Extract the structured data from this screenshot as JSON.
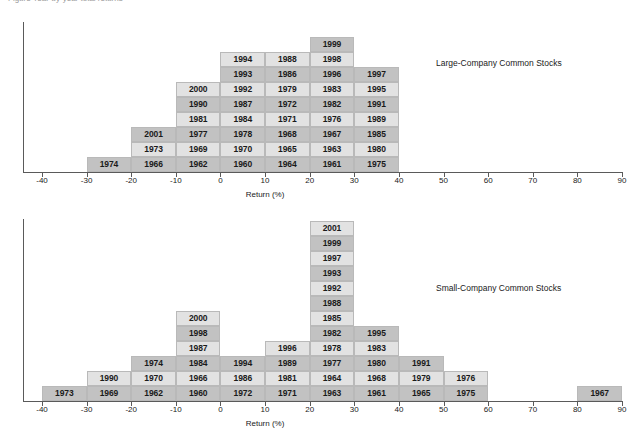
{
  "figure": {
    "title": "Figure  Year-by-year total returns",
    "axis_title": "Return (%)"
  },
  "chart_data": [
    {
      "type": "bar",
      "name": "large-company",
      "title": "Large-Company Common Stocks",
      "xlabel": "Return (%)",
      "ylabel": "",
      "xlim": [
        -45,
        90
      ],
      "bin_width": 10,
      "grid": false,
      "tick_labels": [
        "-40",
        "-30",
        "-20",
        "-10",
        "0",
        "10",
        "20",
        "30",
        "40",
        "50",
        "60",
        "70",
        "80",
        "90"
      ],
      "tick_values": [
        -40,
        -30,
        -20,
        -10,
        0,
        10,
        20,
        30,
        40,
        50,
        60,
        70,
        80,
        90
      ],
      "bins": [
        {
          "start": -30,
          "end": -20,
          "count": 1,
          "labels": [
            "1974"
          ]
        },
        {
          "start": -20,
          "end": -10,
          "count": 3,
          "labels": [
            "1966",
            "1973",
            "2001"
          ]
        },
        {
          "start": -10,
          "end": 0,
          "count": 6,
          "labels": [
            "1962",
            "1969",
            "1977",
            "1981",
            "1990",
            "2000"
          ]
        },
        {
          "start": 0,
          "end": 10,
          "count": 8,
          "labels": [
            "1960",
            "1970",
            "1978",
            "1984",
            "1987",
            "1992",
            "1993",
            "1994"
          ]
        },
        {
          "start": 10,
          "end": 20,
          "count": 7,
          "labels": [
            "1964",
            "1965",
            "1968",
            "1971",
            "1972",
            "1979",
            "1986",
            "1988"
          ]
        },
        {
          "start": 20,
          "end": 30,
          "count": 9,
          "labels": [
            "1961",
            "1963",
            "1967",
            "1976",
            "1982",
            "1983",
            "1996",
            "1998",
            "1999"
          ]
        },
        {
          "start": 30,
          "end": 40,
          "count": 6,
          "labels": [
            "1975",
            "1980",
            "1985",
            "1989",
            "1991",
            "1995",
            "1997"
          ]
        }
      ],
      "columns": [
        {
          "bin_start": -30,
          "labels": [
            "1974"
          ]
        },
        {
          "bin_start": -20,
          "labels": [
            "1966",
            "1973",
            "2001"
          ]
        },
        {
          "bin_start": -10,
          "labels": [
            "1962",
            "1969",
            "1977",
            "1981",
            "1990",
            "2000"
          ]
        },
        {
          "bin_start": 0,
          "labels": [
            "1960",
            "1970",
            "1978",
            "1984",
            "1987",
            "1992",
            "1993",
            "1994"
          ]
        },
        {
          "bin_start": 10,
          "labels": [
            "1964",
            "1965",
            "1968",
            "1971",
            "1972",
            "1979",
            "1986",
            "1988"
          ]
        },
        {
          "bin_start": 20,
          "labels": [
            "1961",
            "1963",
            "1967",
            "1976",
            "1982",
            "1983",
            "1996",
            "1998",
            "1999"
          ]
        },
        {
          "bin_start": 30,
          "labels": [
            "1975",
            "1980",
            "1985",
            "1989",
            "1991",
            "1995",
            "1997"
          ]
        }
      ]
    },
    {
      "type": "bar",
      "name": "small-company",
      "title": "Small-Company Common Stocks",
      "xlabel": "Return (%)",
      "ylabel": "",
      "xlim": [
        -45,
        90
      ],
      "bin_width": 10,
      "grid": false,
      "tick_labels": [
        "-40",
        "-30",
        "-20",
        "-10",
        "0",
        "10",
        "20",
        "30",
        "40",
        "50",
        "60",
        "70",
        "80",
        "90"
      ],
      "tick_values": [
        -40,
        -30,
        -20,
        -10,
        0,
        10,
        20,
        30,
        40,
        50,
        60,
        70,
        80,
        90
      ],
      "columns": [
        {
          "bin_start": -40,
          "labels": [
            "1973"
          ]
        },
        {
          "bin_start": -30,
          "labels": [
            "1969",
            "1990"
          ]
        },
        {
          "bin_start": -20,
          "labels": [
            "1962",
            "1970",
            "1974"
          ]
        },
        {
          "bin_start": -10,
          "labels": [
            "1960",
            "1966",
            "1984",
            "1987",
            "1998",
            "2000"
          ]
        },
        {
          "bin_start": 0,
          "labels": [
            "1972",
            "1986",
            "1994"
          ]
        },
        {
          "bin_start": 10,
          "labels": [
            "1971",
            "1981",
            "1989",
            "1996"
          ]
        },
        {
          "bin_start": 20,
          "labels": [
            "1963",
            "1964",
            "1977",
            "1978",
            "1982",
            "1985",
            "1988",
            "1992",
            "1993",
            "1997",
            "1999",
            "2001"
          ]
        },
        {
          "bin_start": 30,
          "labels": [
            "1961",
            "1968",
            "1980",
            "1983",
            "1995"
          ]
        },
        {
          "bin_start": 40,
          "labels": [
            "1965",
            "1979",
            "1991"
          ]
        },
        {
          "bin_start": 50,
          "labels": [
            "1975",
            "1976"
          ]
        },
        {
          "bin_start": 80,
          "labels": [
            "1967"
          ]
        }
      ]
    }
  ]
}
